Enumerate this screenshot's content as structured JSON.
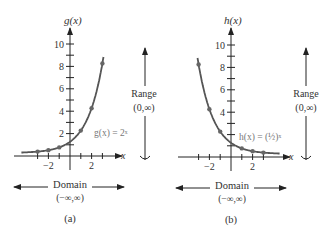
{
  "colors": {
    "curve": "#5a5a5a",
    "point": "#666666",
    "axis": "#222222",
    "text": "#333333",
    "label_gray": "#777777"
  },
  "chart_data": [
    {
      "type": "line",
      "panel": "(a)",
      "title": "",
      "ylabel": "g(x)",
      "xlabel": "x",
      "function_label": "g(x) = 2ˣ",
      "x_ticks": [
        -3,
        -2,
        -1,
        1,
        2,
        3
      ],
      "x_tick_labels": [
        "−2",
        "2"
      ],
      "y_ticks": [
        1,
        2,
        3,
        4,
        5,
        6,
        7,
        8,
        9,
        10
      ],
      "y_tick_labels": [
        "2",
        "4",
        "6",
        "8",
        "10"
      ],
      "points": [
        [
          -3,
          0.125
        ],
        [
          -2,
          0.25
        ],
        [
          -1,
          0.5
        ],
        [
          1,
          2
        ],
        [
          2,
          4
        ],
        [
          3,
          8
        ]
      ],
      "xlim": [
        -4,
        4
      ],
      "ylim": [
        0,
        11
      ],
      "range_label": "Range",
      "range_value": "(0,∞)",
      "domain_label": "Domain",
      "domain_value": "(−∞,∞)"
    },
    {
      "type": "line",
      "panel": "(b)",
      "title": "",
      "ylabel": "h(x)",
      "xlabel": "x",
      "function_label": "h(x) = (½)ˣ",
      "x_ticks": [
        -3,
        -2,
        -1,
        1,
        2,
        3
      ],
      "x_tick_labels": [
        "−2",
        "2"
      ],
      "y_ticks": [
        1,
        2,
        3,
        4,
        5,
        6,
        7,
        8,
        9,
        10
      ],
      "y_tick_labels": [
        "4",
        "6",
        "8",
        "10"
      ],
      "points": [
        [
          -3,
          8
        ],
        [
          -2,
          4
        ],
        [
          -1,
          2
        ],
        [
          1,
          0.5
        ],
        [
          2,
          0.25
        ],
        [
          3,
          0.125
        ]
      ],
      "xlim": [
        -4,
        4
      ],
      "ylim": [
        0,
        11
      ],
      "range_label": "Range",
      "range_value": "(0,∞)",
      "domain_label": "Domain",
      "domain_value": "(−∞,∞)"
    }
  ]
}
